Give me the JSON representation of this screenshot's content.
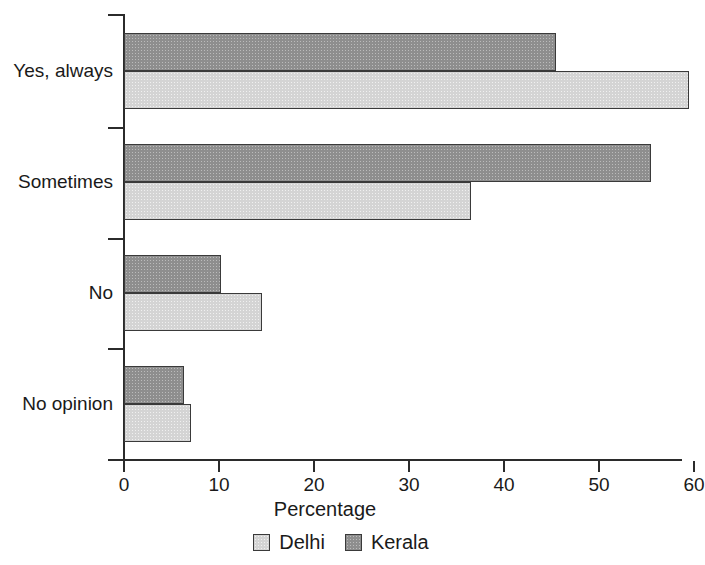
{
  "chart_data": {
    "type": "bar",
    "orientation": "horizontal",
    "title": "",
    "xlabel": "Percentage",
    "ylabel": "",
    "xlim": [
      0,
      70
    ],
    "xticks": [
      0,
      10,
      20,
      30,
      40,
      50,
      60
    ],
    "xtick_labels": [
      "0",
      "10",
      "20",
      "30",
      "40",
      "50",
      "60"
    ],
    "grid": false,
    "legend_position": "bottom",
    "categories": [
      "Yes, always",
      "Sometimes",
      "No",
      "No opinion"
    ],
    "series": [
      {
        "name": "Delhi",
        "color": "#d4d4d4",
        "values": [
          59.5,
          36.5,
          14.5,
          7.0
        ]
      },
      {
        "name": "Kerala",
        "color": "#8e8e8e",
        "values": [
          45.5,
          55.5,
          10.2,
          6.3
        ]
      }
    ]
  },
  "axis": {
    "x_title": "Percentage"
  },
  "legend": {
    "entries": [
      {
        "label": "Delhi",
        "swatch": "delhi-swatch"
      },
      {
        "label": "Kerala",
        "swatch": "kerala-swatch"
      }
    ]
  }
}
